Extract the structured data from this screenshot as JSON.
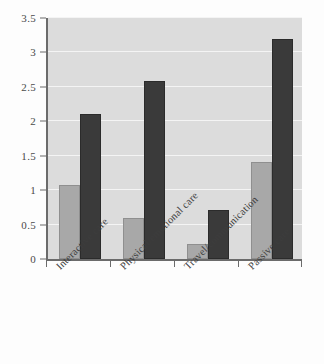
{
  "chart_data": {
    "type": "bar",
    "title": "",
    "subtitle": "",
    "xlabel": "",
    "ylabel": "",
    "categories": [
      "Interactive care",
      "Physical/emotional care",
      "Travel/communication",
      "Passive care"
    ],
    "series": [
      {
        "name": "Series 1",
        "color": "#a8a8a8",
        "values": [
          1.07,
          0.59,
          0.22,
          1.41
        ]
      },
      {
        "name": "Series 2",
        "color": "#3a3a3a",
        "values": [
          2.11,
          2.58,
          0.71,
          3.2
        ]
      }
    ],
    "ylim": [
      0,
      3.5
    ],
    "yticks": [
      0,
      0.5,
      1,
      1.5,
      2,
      2.5,
      3,
      3.5
    ],
    "ytick_labels": [
      "0",
      "0.5",
      "1",
      "1.5",
      "2",
      "2.5",
      "3",
      "3.5"
    ],
    "grid": true,
    "grid_axis": "y",
    "grid_color": "#f4f4f4",
    "legend": false,
    "legend_position": "none",
    "plot_background": "#dcdcdc",
    "figure_background": "#fdfdfd",
    "axis_color": "#6b6b6b",
    "xtick_label_rotation": -45,
    "annotations": []
  }
}
